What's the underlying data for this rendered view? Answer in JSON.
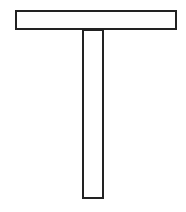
{
  "diagram": {
    "stroke_color": "#222222",
    "fill_color": "#ffffff",
    "stroke_width": 2,
    "shapes": [
      {
        "name": "crossbar",
        "x": 15,
        "y": 10,
        "width": 162,
        "height": 20
      },
      {
        "name": "stem",
        "x": 82,
        "y": 29,
        "width": 22,
        "height": 170
      }
    ]
  }
}
